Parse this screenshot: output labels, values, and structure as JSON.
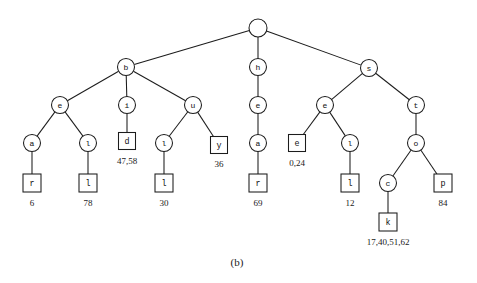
{
  "figure": {
    "caption": "(b)",
    "caption_x": 237,
    "caption_y": 262,
    "background_color": "#ffffff",
    "stroke_color": "#1c1c1c",
    "type": "trie-tree-diagram"
  },
  "chart_data": {
    "type": "diagram",
    "title": "(b)",
    "nodes": [
      {
        "id": "root",
        "label": "",
        "shape": "circle",
        "x": 258,
        "y": 28,
        "r": 9
      },
      {
        "id": "b",
        "label": "b",
        "shape": "circle",
        "x": 126,
        "y": 67,
        "r": 8.5
      },
      {
        "id": "h",
        "label": "h",
        "shape": "circle",
        "x": 258,
        "y": 67,
        "r": 8.5
      },
      {
        "id": "s",
        "label": "s",
        "shape": "circle",
        "x": 369,
        "y": 68,
        "r": 8.5
      },
      {
        "id": "e1",
        "label": "e",
        "shape": "circle",
        "x": 60,
        "y": 105,
        "r": 8.5
      },
      {
        "id": "i",
        "label": "i",
        "shape": "circle",
        "x": 127,
        "y": 105,
        "r": 8.5
      },
      {
        "id": "u",
        "label": "u",
        "shape": "circle",
        "x": 193,
        "y": 105,
        "r": 8.5
      },
      {
        "id": "e2",
        "label": "e",
        "shape": "circle",
        "x": 258,
        "y": 105,
        "r": 8.5
      },
      {
        "id": "e3",
        "label": "e",
        "shape": "circle",
        "x": 325,
        "y": 105,
        "r": 8.5
      },
      {
        "id": "t",
        "label": "t",
        "shape": "circle",
        "x": 416,
        "y": 105,
        "r": 8.5
      },
      {
        "id": "a1",
        "label": "a",
        "shape": "circle",
        "x": 32,
        "y": 143,
        "r": 8.5
      },
      {
        "id": "l1",
        "label": "l",
        "shape": "circle",
        "x": 88,
        "y": 143,
        "r": 8.5
      },
      {
        "id": "d",
        "label": "d",
        "shape": "square",
        "x": 127,
        "y": 141,
        "size": 17
      },
      {
        "id": "l2",
        "label": "l",
        "shape": "circle",
        "x": 164,
        "y": 143,
        "r": 8.5
      },
      {
        "id": "y",
        "label": "y",
        "shape": "square",
        "x": 219,
        "y": 145,
        "size": 17
      },
      {
        "id": "a2",
        "label": "a",
        "shape": "circle",
        "x": 258,
        "y": 143,
        "r": 8.5
      },
      {
        "id": "e4",
        "label": "e",
        "shape": "square",
        "x": 297,
        "y": 143,
        "size": 17
      },
      {
        "id": "l3",
        "label": "l",
        "shape": "circle",
        "x": 350,
        "y": 143,
        "r": 8.5
      },
      {
        "id": "o",
        "label": "o",
        "shape": "circle",
        "x": 416,
        "y": 143,
        "r": 8.5
      },
      {
        "id": "r1",
        "label": "r",
        "shape": "square",
        "x": 32,
        "y": 183,
        "size": 18
      },
      {
        "id": "l4",
        "label": "l",
        "shape": "square",
        "x": 88,
        "y": 183,
        "size": 18
      },
      {
        "id": "l5",
        "label": "l",
        "shape": "square",
        "x": 164,
        "y": 183,
        "size": 18
      },
      {
        "id": "r2",
        "label": "r",
        "shape": "square",
        "x": 258,
        "y": 183,
        "size": 18
      },
      {
        "id": "l6",
        "label": "l",
        "shape": "square",
        "x": 350,
        "y": 183,
        "size": 18
      },
      {
        "id": "c",
        "label": "c",
        "shape": "circle",
        "x": 388,
        "y": 183,
        "r": 8.5
      },
      {
        "id": "p",
        "label": "p",
        "shape": "square",
        "x": 443,
        "y": 183,
        "size": 18
      },
      {
        "id": "k",
        "label": "k",
        "shape": "square",
        "x": 388,
        "y": 222,
        "size": 18
      }
    ],
    "edges": [
      {
        "from": "root",
        "to": "b"
      },
      {
        "from": "root",
        "to": "h"
      },
      {
        "from": "root",
        "to": "s"
      },
      {
        "from": "b",
        "to": "e1"
      },
      {
        "from": "b",
        "to": "i"
      },
      {
        "from": "b",
        "to": "u"
      },
      {
        "from": "h",
        "to": "e2"
      },
      {
        "from": "s",
        "to": "e3"
      },
      {
        "from": "s",
        "to": "t"
      },
      {
        "from": "e1",
        "to": "a1"
      },
      {
        "from": "e1",
        "to": "l1"
      },
      {
        "from": "i",
        "to": "d"
      },
      {
        "from": "u",
        "to": "l2"
      },
      {
        "from": "u",
        "to": "y"
      },
      {
        "from": "e2",
        "to": "a2"
      },
      {
        "from": "e3",
        "to": "e4"
      },
      {
        "from": "e3",
        "to": "l3"
      },
      {
        "from": "t",
        "to": "o"
      },
      {
        "from": "a1",
        "to": "r1"
      },
      {
        "from": "l1",
        "to": "l4"
      },
      {
        "from": "l2",
        "to": "l5"
      },
      {
        "from": "a2",
        "to": "r2"
      },
      {
        "from": "l3",
        "to": "l6"
      },
      {
        "from": "o",
        "to": "c"
      },
      {
        "from": "o",
        "to": "p"
      },
      {
        "from": "c",
        "to": "k"
      }
    ],
    "value_labels": [
      {
        "node": "r1",
        "text": "6",
        "x": 32,
        "y": 203
      },
      {
        "node": "l4",
        "text": "78",
        "x": 88,
        "y": 203
      },
      {
        "node": "d",
        "text": "47,58",
        "x": 127,
        "y": 161
      },
      {
        "node": "l5",
        "text": "30",
        "x": 164,
        "y": 203
      },
      {
        "node": "y",
        "text": "36",
        "x": 219,
        "y": 164
      },
      {
        "node": "r2",
        "text": "69",
        "x": 258,
        "y": 203
      },
      {
        "node": "e4",
        "text": "0,24",
        "x": 297,
        "y": 163
      },
      {
        "node": "l6",
        "text": "12",
        "x": 350,
        "y": 203
      },
      {
        "node": "p",
        "text": "84",
        "x": 443,
        "y": 203
      },
      {
        "node": "k",
        "text": "17,40,51,62",
        "x": 388,
        "y": 242
      }
    ]
  }
}
